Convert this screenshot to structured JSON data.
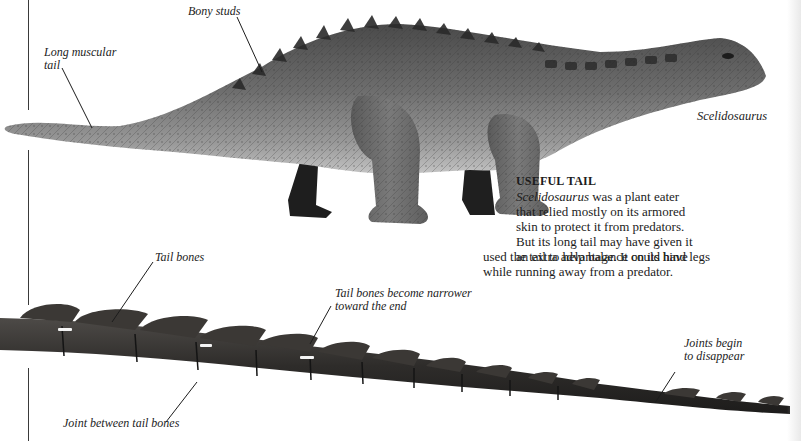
{
  "page": {
    "background": "#ffffff",
    "ink_color": "#1c1c1c"
  },
  "illustration_model": {
    "species_label": "Scelidosaurus",
    "callouts": {
      "bony_studs": "Bony studs",
      "long_muscular_tail_line1": "Long muscular",
      "long_muscular_tail_line2": "tail"
    }
  },
  "text_box": {
    "heading": "USEFUL TAIL",
    "lines": [
      {
        "italic_lead": "Scelidosaurus",
        "rest": " was a plant eater"
      },
      {
        "italic_lead": "",
        "rest": "that relied mostly on its armored"
      },
      {
        "italic_lead": "",
        "rest": "skin to protect it from predators."
      },
      {
        "italic_lead": "",
        "rest": "But its long tail may have given it"
      },
      {
        "italic_lead": "",
        "rest": "an extra advantage. It could have"
      },
      {
        "italic_lead": "",
        "rest": "used the tail to help balance on its hind legs"
      },
      {
        "italic_lead": "",
        "rest": "while running away from a predator."
      }
    ]
  },
  "illustration_fossil": {
    "callouts": {
      "tail_bones": "Tail bones",
      "narrower_line1": "Tail bones become narrower",
      "narrower_line2": "toward the end",
      "joints_line1": "Joints begin",
      "joints_line2": "to disappear",
      "joint_between": "Joint between tail bones"
    }
  }
}
